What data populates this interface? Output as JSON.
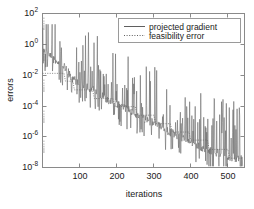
{
  "figure": {
    "background": "#ffffff",
    "axes_color": "#8a8a8a",
    "series_color": "#6b6b6b"
  },
  "chart_data": {
    "type": "line",
    "title": "",
    "xlabel": "iterations",
    "ylabel": "errors",
    "yscale": "log",
    "xscale": "linear",
    "xlim": [
      0,
      545
    ],
    "ylim": [
      1e-08,
      100
    ],
    "grid": false,
    "legend_position": "top-right",
    "xticks": [
      100,
      200,
      300,
      400,
      500
    ],
    "xticklabels": [
      "100",
      "200",
      "300",
      "400",
      "500"
    ],
    "yticks": [
      100,
      1,
      0.01,
      0.0001,
      1e-06,
      1e-08
    ],
    "yticklabels": [
      "10",
      "10",
      "10",
      "10",
      "10",
      "10"
    ],
    "ytick_exponents": [
      "2",
      "0",
      "-2",
      "-4",
      "-6",
      "-8"
    ],
    "series": [
      {
        "name": "projected gradient",
        "style": "solid",
        "color": "#6b6b6b",
        "description": "Spiky monotone-decreasing envelope from about 1e0 at iteration 1 down to about 3e-8 at iteration 540, with frequent upward spikes reaching up to 1e1.",
        "envelope_x": [
          1,
          20,
          40,
          60,
          80,
          100,
          130,
          160,
          200,
          240,
          280,
          320,
          360,
          400,
          440,
          480,
          520,
          540
        ],
        "envelope_y": [
          0.4,
          0.15,
          0.07,
          0.03,
          0.006,
          0.003,
          0.0012,
          0.0004,
          0.00012,
          4e-05,
          1.2e-05,
          4e-06,
          1.2e-06,
          4e-07,
          1.5e-07,
          7e-08,
          4e-08,
          3e-08
        ],
        "spike_peaks_y": [
          10.0,
          3.0,
          1.0,
          0.3,
          0.1,
          0.03,
          0.01,
          0.003,
          0.001,
          0.0003,
          0.0001,
          3e-05,
          1e-05,
          3e-06,
          1e-06
        ]
      },
      {
        "name": "feasibility error",
        "style": "dotted",
        "color": "#6b6b6b",
        "description": "Descending staircase: flat plateau near 1.3e-2 until iteration 60, then stepwise drops roughly every 50 iterations down to about 2e-8.",
        "step_x": [
          0,
          58,
          62,
          82,
          86,
          135,
          140,
          190,
          196,
          250,
          256,
          300,
          306,
          345,
          350,
          395,
          400,
          445,
          450,
          500,
          505,
          540
        ],
        "step_y": [
          0.013,
          0.013,
          0.004,
          0.004,
          0.0011,
          0.0011,
          0.0003,
          0.0003,
          9e-05,
          9e-05,
          2.5e-05,
          2.5e-05,
          7e-06,
          7e-06,
          2e-06,
          2e-06,
          6e-07,
          6e-07,
          1.5e-07,
          1.5e-07,
          4e-08,
          4e-08
        ]
      }
    ]
  },
  "legend": {
    "items": [
      {
        "label": "projected gradient",
        "marker": "solid-line"
      },
      {
        "label": "feasibility error",
        "marker": "dotted-line"
      }
    ]
  }
}
